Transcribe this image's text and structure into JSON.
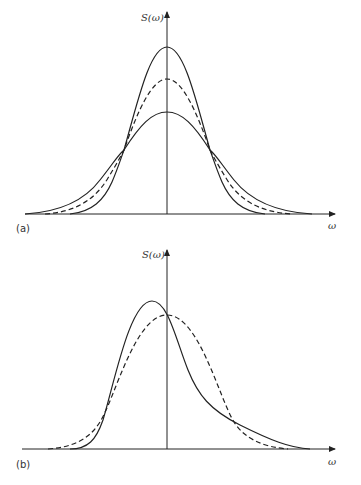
{
  "figure": {
    "panels": [
      {
        "id": "a",
        "panel_label": "(a)",
        "y_axis_label": "S(ω)",
        "x_axis_label": "ω",
        "curves": [
          {
            "name": "narrow solid",
            "style": "solid",
            "description": "tallest, narrowest symmetric peak"
          },
          {
            "name": "dashed",
            "style": "dashed",
            "description": "intermediate symmetric peak"
          },
          {
            "name": "wide solid",
            "style": "solid",
            "description": "lowest, widest symmetric peak"
          }
        ]
      },
      {
        "id": "b",
        "panel_label": "(b)",
        "y_axis_label": "S(ω)",
        "x_axis_label": "ω",
        "curves": [
          {
            "name": "skewed solid",
            "style": "solid",
            "description": "asymmetric peak shifted left of axis, long right tail"
          },
          {
            "name": "symmetric dashed",
            "style": "dashed",
            "description": "symmetric peak centered on axis"
          }
        ]
      }
    ]
  },
  "colors": {
    "stroke": "#222222",
    "background": "#ffffff"
  }
}
